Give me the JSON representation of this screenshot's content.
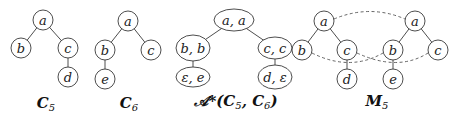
{
  "figure": {
    "trees": [
      {
        "id": "C5",
        "caption": "C",
        "caption_sub": "5",
        "nodes": [
          {
            "id": "a",
            "label": "a",
            "x": 43,
            "y": 20
          },
          {
            "id": "b",
            "label": "b",
            "x": 21,
            "y": 48
          },
          {
            "id": "c",
            "label": "c",
            "x": 68,
            "y": 48
          },
          {
            "id": "d",
            "label": "d",
            "x": 68,
            "y": 77
          }
        ],
        "edges": [
          [
            "a",
            "b"
          ],
          [
            "a",
            "c"
          ],
          [
            "c",
            "d"
          ]
        ]
      },
      {
        "id": "C6",
        "caption": "C",
        "caption_sub": "6",
        "nodes": [
          {
            "id": "a",
            "label": "a",
            "x": 128,
            "y": 21
          },
          {
            "id": "b",
            "label": "b",
            "x": 105,
            "y": 50
          },
          {
            "id": "c",
            "label": "c",
            "x": 151,
            "y": 50
          },
          {
            "id": "e",
            "label": "e",
            "x": 105,
            "y": 79
          }
        ],
        "edges": [
          [
            "a",
            "b"
          ],
          [
            "a",
            "c"
          ],
          [
            "b",
            "e"
          ]
        ]
      },
      {
        "id": "A*",
        "caption": "𝒜*(C",
        "caption_full": "𝒜*(C5, C6)",
        "nodes": [
          {
            "id": "aa",
            "label": "a, a",
            "x": 234,
            "y": 20
          },
          {
            "id": "bb",
            "label": "b, b",
            "x": 193,
            "y": 48
          },
          {
            "id": "cc",
            "label": "c, c",
            "x": 275,
            "y": 48
          },
          {
            "id": "ee",
            "label": "ε, e",
            "x": 193,
            "y": 77
          },
          {
            "id": "de",
            "label": "d, ε",
            "x": 275,
            "y": 77
          }
        ],
        "edges": [
          [
            "aa",
            "bb"
          ],
          [
            "aa",
            "cc"
          ],
          [
            "bb",
            "ee"
          ],
          [
            "cc",
            "de"
          ]
        ]
      },
      {
        "id": "M5",
        "caption": "M",
        "caption_sub": "5",
        "nodes": [
          {
            "id": "la",
            "label": "a",
            "x": 324,
            "y": 21
          },
          {
            "id": "lb",
            "label": "b",
            "x": 302,
            "y": 50
          },
          {
            "id": "lc",
            "label": "c",
            "x": 347,
            "y": 50
          },
          {
            "id": "ld",
            "label": "d",
            "x": 347,
            "y": 79
          },
          {
            "id": "ra",
            "label": "a",
            "x": 415,
            "y": 21
          },
          {
            "id": "rb",
            "label": "b",
            "x": 393,
            "y": 50
          },
          {
            "id": "rc",
            "label": "c",
            "x": 438,
            "y": 50
          },
          {
            "id": "re",
            "label": "e",
            "x": 393,
            "y": 79
          }
        ],
        "edges": [
          [
            "la",
            "lb"
          ],
          [
            "la",
            "lc"
          ],
          [
            "lc",
            "ld"
          ],
          [
            "ra",
            "rb"
          ],
          [
            "ra",
            "rc"
          ],
          [
            "rb",
            "re"
          ]
        ],
        "mapping_edges": [
          [
            "la",
            "ra"
          ],
          [
            "lb",
            "rb"
          ],
          [
            "lc",
            "rc"
          ]
        ]
      }
    ],
    "captions": {
      "c5": {
        "main": "C",
        "sub": "5"
      },
      "c6": {
        "main": "C",
        "sub": "6"
      },
      "astar": {
        "main": "𝒜*(C",
        "sub1": "5",
        "mid": ", C",
        "sub2": "6",
        "end": ")"
      },
      "m5": {
        "main": "M",
        "sub": "5"
      }
    },
    "node_labels": {
      "c5": [
        "a",
        "b",
        "c",
        "d"
      ],
      "c6": [
        "a",
        "b",
        "c",
        "e"
      ],
      "astar": [
        "a, a",
        "b, b",
        "c, c",
        "ε, e",
        "d, ε"
      ],
      "m5_left": [
        "a",
        "b",
        "c",
        "d"
      ],
      "m5_right": [
        "a",
        "b",
        "c",
        "e"
      ]
    }
  }
}
